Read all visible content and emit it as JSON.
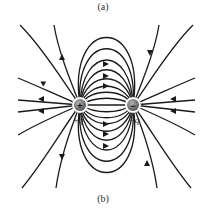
{
  "captions": {
    "top": "(a)",
    "bottom": "(b)"
  },
  "charges": {
    "positive": {
      "symbol": "+",
      "label": "+q",
      "color": "#6b6b6b"
    },
    "negative": {
      "symbol": "−",
      "label": "−q",
      "color": "#6b6b6b"
    }
  },
  "diagram": {
    "line_color": "#1a1a1a"
  }
}
